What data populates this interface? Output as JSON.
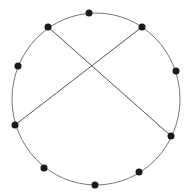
{
  "diagram": {
    "width": 187,
    "height": 193,
    "background": "#ffffff",
    "circle": {
      "cx": 96,
      "cy": 99,
      "rx": 84,
      "ry": 86,
      "stroke": "#777777",
      "stroke_width": 1
    },
    "points": [
      {
        "id": "p1",
        "x": 89,
        "y": 13
      },
      {
        "id": "p2",
        "x": 142,
        "y": 27
      },
      {
        "id": "p3",
        "x": 176,
        "y": 71
      },
      {
        "id": "p4",
        "x": 171,
        "y": 136
      },
      {
        "id": "p5",
        "x": 139,
        "y": 172
      },
      {
        "id": "p6",
        "x": 95,
        "y": 185
      },
      {
        "id": "p7",
        "x": 44,
        "y": 168
      },
      {
        "id": "p8",
        "x": 15,
        "y": 125
      },
      {
        "id": "p9",
        "x": 18,
        "y": 66
      },
      {
        "id": "p10",
        "x": 48,
        "y": 27
      }
    ],
    "point_style": {
      "r": 3.5,
      "fill": "#1a1a1a"
    },
    "chords": [
      {
        "from": "p10",
        "to": "p4"
      },
      {
        "from": "p2",
        "to": "p8"
      }
    ],
    "chord_style": {
      "stroke": "#555555",
      "stroke_width": 1
    }
  }
}
